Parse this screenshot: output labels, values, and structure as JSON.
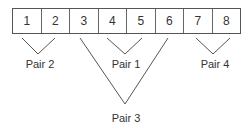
{
  "diagram": {
    "cells": [
      "1",
      "2",
      "3",
      "4",
      "5",
      "6",
      "7",
      "8"
    ],
    "pairs": [
      {
        "label": "Pair 1",
        "members": [
          "4",
          "5"
        ]
      },
      {
        "label": "Pair 2",
        "members": [
          "1",
          "2"
        ]
      },
      {
        "label": "Pair 3",
        "members": [
          "3",
          "6"
        ]
      },
      {
        "label": "Pair 4",
        "members": [
          "7",
          "8"
        ]
      }
    ]
  }
}
